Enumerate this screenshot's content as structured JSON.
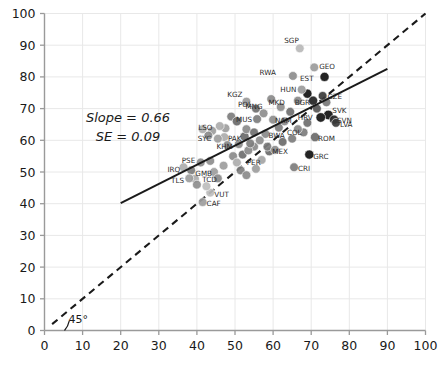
{
  "chart_data": {
    "type": "scatter",
    "title": "",
    "xlabel": "",
    "ylabel": "",
    "xlim": [
      0,
      100
    ],
    "ylim": [
      0,
      100
    ],
    "xticks": [
      0,
      10,
      20,
      30,
      40,
      50,
      60,
      70,
      80,
      90,
      100
    ],
    "yticks": [
      0,
      10,
      20,
      30,
      40,
      50,
      60,
      70,
      80,
      90,
      100
    ],
    "grid": true,
    "legend": "none",
    "annotations": {
      "slope_label": "Slope = 0.66",
      "se_label": "SE = 0.09",
      "angle_label": "45°"
    },
    "fit_line": {
      "style": "solid",
      "color": "#1a1a1a",
      "slope": 0.66,
      "se": 0.09,
      "x0": 20.0,
      "y0": 40.2,
      "x1": 90.0,
      "y1": 82.5
    },
    "identity_line": {
      "style": "dashed",
      "color": "#1a1a1a",
      "x0": 2.0,
      "y0": 2.0,
      "x1": 100.0,
      "y1": 100.0
    },
    "angle_arc": {
      "x": 6.5,
      "y": 3.0
    },
    "points": [
      {
        "label": "SGP",
        "x": 67.0,
        "y": 89.0,
        "color": "#b9b9b9",
        "r": 4.4,
        "lx": -1,
        "ly": -5
      },
      {
        "label": "GEO",
        "x": 70.8,
        "y": 83.0,
        "color": "#9b9b9b",
        "r": 4.4,
        "lx": 5,
        "ly": 2
      },
      {
        "label": "RWA",
        "x": 65.2,
        "y": 80.3,
        "color": "#8d8d8d",
        "r": 4.4,
        "lx": -17,
        "ly": -1
      },
      {
        "label": "EST",
        "x": 73.5,
        "y": 80.0,
        "color": "#111111",
        "r": 4.6,
        "lx": -11,
        "ly": 4
      },
      {
        "label": "KGZ",
        "x": 53.0,
        "y": 72.2,
        "color": "#9a9a9a",
        "r": 4.4,
        "lx": -4,
        "ly": -5
      },
      {
        "label": "HUN",
        "x": 69.0,
        "y": 74.7,
        "color": "#111111",
        "r": 4.6,
        "lx": -11,
        "ly": -2
      },
      {
        "label": "MKD",
        "x": 66.5,
        "y": 72.5,
        "color": "#8a8a8a",
        "r": 4.4,
        "lx": -13,
        "ly": 4
      },
      {
        "label": "BGR",
        "x": 70.5,
        "y": 72.5,
        "color": "#222222",
        "r": 4.6,
        "lx": -3,
        "ly": 4
      },
      {
        "label": "POL",
        "x": 55.5,
        "y": 70.0,
        "color": "#6f6f6f",
        "r": 4.4,
        "lx": -4,
        "ly": -2
      },
      {
        "label": "MNG",
        "x": 57.5,
        "y": 68.5,
        "color": "#8d8d8d",
        "r": 4.4,
        "lx": -1,
        "ly": -4
      },
      {
        "label": "MUS",
        "x": 55.8,
        "y": 66.7,
        "color": "#7d7d7d",
        "r": 4.4,
        "lx": -5,
        "ly": 3
      },
      {
        "label": "NAM",
        "x": 60.0,
        "y": 66.5,
        "color": "#8d8d8d",
        "r": 4.4,
        "lx": 2,
        "ly": 3
      },
      {
        "label": "CZE",
        "x": 74.0,
        "y": 72.0,
        "color": "#777777",
        "r": 4.4,
        "lx": 1,
        "ly": -3
      },
      {
        "label": "SVK",
        "x": 74.5,
        "y": 68.0,
        "color": "#111111",
        "r": 4.8,
        "lx": 4,
        "ly": -2
      },
      {
        "label": "HRV",
        "x": 72.5,
        "y": 67.2,
        "color": "#111111",
        "r": 4.8,
        "lx": -8,
        "ly": 3
      },
      {
        "label": "SVN",
        "x": 76.0,
        "y": 66.5,
        "color": "#222222",
        "r": 4.6,
        "lx": 3,
        "ly": 3
      },
      {
        "label": "LVA",
        "x": 76.5,
        "y": 65.5,
        "color": "#3a3a3a",
        "r": 4.4,
        "lx": 4,
        "ly": 4
      },
      {
        "label": "LSO",
        "x": 47.5,
        "y": 63.8,
        "color": "#9d9d9d",
        "r": 4.4,
        "lx": -13,
        "ly": 2
      },
      {
        "label": "SYC",
        "x": 47.2,
        "y": 61.0,
        "color": "#adadad",
        "r": 4.4,
        "lx": -13,
        "ly": 4
      },
      {
        "label": "PAK",
        "x": 52.5,
        "y": 61.2,
        "color": "#6a6a6a",
        "r": 4.6,
        "lx": -3,
        "ly": 5
      },
      {
        "label": "KHM",
        "x": 51.0,
        "y": 58.8,
        "color": "#8a8a8a",
        "r": 4.4,
        "lx": -6,
        "ly": 5
      },
      {
        "label": "BWA",
        "x": 58.0,
        "y": 62.0,
        "color": "#8a8a8a",
        "r": 4.4,
        "lx": 3,
        "ly": 4
      },
      {
        "label": "COL",
        "x": 68.0,
        "y": 62.5,
        "color": "#7d7d7d",
        "r": 4.4,
        "lx": -2,
        "ly": 3
      },
      {
        "label": "ROM",
        "x": 71.0,
        "y": 61.0,
        "color": "#6a6a6a",
        "r": 4.6,
        "lx": 3,
        "ly": 4
      },
      {
        "label": "SGP2",
        "x": 55.0,
        "y": 58.0,
        "color": "#8a8a8a",
        "r": 4.4,
        "lx": 0,
        "ly": 4
      },
      {
        "label": "MEX",
        "x": 59.0,
        "y": 56.5,
        "color": "#6a6a6a",
        "r": 4.4,
        "lx": 3,
        "ly": 3
      },
      {
        "label": "PER",
        "x": 57.0,
        "y": 53.8,
        "color": "#a5a5a5",
        "r": 4.4,
        "lx": -1,
        "ly": 5
      },
      {
        "label": "GRC",
        "x": 69.5,
        "y": 55.5,
        "color": "#111111",
        "r": 4.6,
        "lx": 4,
        "ly": 4
      },
      {
        "label": "CRI",
        "x": 65.5,
        "y": 51.5,
        "color": "#7d7d7d",
        "r": 4.4,
        "lx": 4,
        "ly": 4
      },
      {
        "label": "PSE",
        "x": 43.5,
        "y": 53.5,
        "color": "#8d8d8d",
        "r": 4.4,
        "lx": -15,
        "ly": 2
      },
      {
        "label": "GMB",
        "x": 44.5,
        "y": 50.0,
        "color": "#9d9d9d",
        "r": 4.4,
        "lx": -2,
        "ly": 4
      },
      {
        "label": "TCD",
        "x": 45.5,
        "y": 48.0,
        "color": "#8a8a8a",
        "r": 4.4,
        "lx": -1,
        "ly": 4
      },
      {
        "label": "IRQ",
        "x": 38.5,
        "y": 50.5,
        "color": "#7d7d7d",
        "r": 4.4,
        "lx": -11,
        "ly": 2
      },
      {
        "label": "TLS",
        "x": 39.5,
        "y": 47.8,
        "color": "#adadad",
        "r": 4.4,
        "lx": -11,
        "ly": 4
      },
      {
        "label": "VUT",
        "x": 43.5,
        "y": 43.5,
        "color": "#bdbdbd",
        "r": 4.4,
        "lx": 4,
        "ly": 4
      },
      {
        "label": "CAF",
        "x": 41.5,
        "y": 40.5,
        "color": "#9d9d9d",
        "r": 4.4,
        "lx": 4,
        "ly": 4
      },
      {
        "label": "",
        "x": 49.5,
        "y": 55.0,
        "color": "#8a8a8a",
        "r": 4.4,
        "lx": 0,
        "ly": 0
      },
      {
        "label": "",
        "x": 52.0,
        "y": 55.5,
        "color": "#6f6f6f",
        "r": 4.4,
        "lx": 0,
        "ly": 0
      },
      {
        "label": "",
        "x": 53.5,
        "y": 56.8,
        "color": "#8a8a8a",
        "r": 4.4,
        "lx": 0,
        "ly": 0
      },
      {
        "label": "",
        "x": 50.5,
        "y": 53.0,
        "color": "#adadad",
        "r": 4.4,
        "lx": 0,
        "ly": 0
      },
      {
        "label": "",
        "x": 47.0,
        "y": 52.0,
        "color": "#9d9d9d",
        "r": 4.4,
        "lx": 0,
        "ly": 0
      },
      {
        "label": "",
        "x": 61.5,
        "y": 64.0,
        "color": "#7d7d7d",
        "r": 4.4,
        "lx": 0,
        "ly": 0
      },
      {
        "label": "",
        "x": 63.0,
        "y": 66.0,
        "color": "#8a8a8a",
        "r": 4.4,
        "lx": 0,
        "ly": 0
      },
      {
        "label": "",
        "x": 64.5,
        "y": 69.0,
        "color": "#6f6f6f",
        "r": 4.4,
        "lx": 0,
        "ly": 0
      },
      {
        "label": "",
        "x": 62.0,
        "y": 70.5,
        "color": "#8d8d8d",
        "r": 4.4,
        "lx": 0,
        "ly": 0
      },
      {
        "label": "",
        "x": 59.5,
        "y": 73.0,
        "color": "#8a8a8a",
        "r": 4.4,
        "lx": 0,
        "ly": 0
      },
      {
        "label": "",
        "x": 67.5,
        "y": 76.0,
        "color": "#9b9b9b",
        "r": 4.4,
        "lx": 0,
        "ly": 0
      },
      {
        "label": "",
        "x": 49.0,
        "y": 67.5,
        "color": "#7d7d7d",
        "r": 4.4,
        "lx": 0,
        "ly": 0
      },
      {
        "label": "",
        "x": 50.5,
        "y": 66.0,
        "color": "#6a6a6a",
        "r": 4.6,
        "lx": 0,
        "ly": 0
      },
      {
        "label": "",
        "x": 46.0,
        "y": 64.5,
        "color": "#adadad",
        "r": 4.4,
        "lx": 0,
        "ly": 0
      },
      {
        "label": "",
        "x": 44.0,
        "y": 63.0,
        "color": "#9d9d9d",
        "r": 4.4,
        "lx": 0,
        "ly": 0
      },
      {
        "label": "",
        "x": 53.0,
        "y": 63.5,
        "color": "#8a8a8a",
        "r": 4.4,
        "lx": 0,
        "ly": 0
      },
      {
        "label": "",
        "x": 55.0,
        "y": 62.5,
        "color": "#6f6f6f",
        "r": 4.4,
        "lx": 0,
        "ly": 0
      },
      {
        "label": "",
        "x": 56.5,
        "y": 60.0,
        "color": "#8d8d8d",
        "r": 4.4,
        "lx": 0,
        "ly": 0
      },
      {
        "label": "",
        "x": 54.0,
        "y": 59.0,
        "color": "#7d7d7d",
        "r": 4.4,
        "lx": 0,
        "ly": 0
      },
      {
        "label": "",
        "x": 48.0,
        "y": 58.5,
        "color": "#8a8a8a",
        "r": 4.4,
        "lx": 0,
        "ly": 0
      },
      {
        "label": "",
        "x": 45.5,
        "y": 60.5,
        "color": "#9d9d9d",
        "r": 4.4,
        "lx": 0,
        "ly": 0
      },
      {
        "label": "",
        "x": 43.0,
        "y": 61.5,
        "color": "#8a8a8a",
        "r": 4.4,
        "lx": 0,
        "ly": 0
      },
      {
        "label": "",
        "x": 41.5,
        "y": 63.5,
        "color": "#adadad",
        "r": 4.4,
        "lx": 0,
        "ly": 0
      },
      {
        "label": "",
        "x": 58.5,
        "y": 58.0,
        "color": "#7d7d7d",
        "r": 4.4,
        "lx": 0,
        "ly": 0
      },
      {
        "label": "",
        "x": 60.5,
        "y": 57.0,
        "color": "#8d8d8d",
        "r": 4.4,
        "lx": 0,
        "ly": 0
      },
      {
        "label": "",
        "x": 62.5,
        "y": 59.5,
        "color": "#6a6a6a",
        "r": 4.4,
        "lx": 0,
        "ly": 0
      },
      {
        "label": "",
        "x": 65.0,
        "y": 60.5,
        "color": "#7d7d7d",
        "r": 4.4,
        "lx": 0,
        "ly": 0
      },
      {
        "label": "",
        "x": 66.5,
        "y": 63.5,
        "color": "#8a8a8a",
        "r": 4.4,
        "lx": 0,
        "ly": 0
      },
      {
        "label": "",
        "x": 69.0,
        "y": 65.5,
        "color": "#6f6f6f",
        "r": 4.4,
        "lx": 0,
        "ly": 0
      },
      {
        "label": "",
        "x": 71.5,
        "y": 70.0,
        "color": "#555555",
        "r": 4.4,
        "lx": 0,
        "ly": 0
      },
      {
        "label": "",
        "x": 73.0,
        "y": 74.0,
        "color": "#3a3a3a",
        "r": 4.4,
        "lx": 0,
        "ly": 0
      },
      {
        "label": "",
        "x": 41.0,
        "y": 53.0,
        "color": "#8a8a8a",
        "r": 4.4,
        "lx": 0,
        "ly": 0
      },
      {
        "label": "",
        "x": 38.0,
        "y": 48.0,
        "color": "#9d9d9d",
        "r": 4.4,
        "lx": 0,
        "ly": 0
      },
      {
        "label": "",
        "x": 40.0,
        "y": 46.0,
        "color": "#8d8d8d",
        "r": 4.4,
        "lx": 0,
        "ly": 0
      },
      {
        "label": "",
        "x": 42.5,
        "y": 45.5,
        "color": "#bdbdbd",
        "r": 4.4,
        "lx": 0,
        "ly": 0
      },
      {
        "label": "",
        "x": 36.5,
        "y": 51.5,
        "color": "#adadad",
        "r": 4.4,
        "lx": 0,
        "ly": 0
      },
      {
        "label": "",
        "x": 51.5,
        "y": 50.5,
        "color": "#7d7d7d",
        "r": 4.4,
        "lx": 0,
        "ly": 0
      },
      {
        "label": "",
        "x": 53.0,
        "y": 49.0,
        "color": "#8a8a8a",
        "r": 4.4,
        "lx": 0,
        "ly": 0
      },
      {
        "label": "",
        "x": 55.5,
        "y": 51.0,
        "color": "#9d9d9d",
        "r": 4.4,
        "lx": 0,
        "ly": 0
      }
    ]
  }
}
